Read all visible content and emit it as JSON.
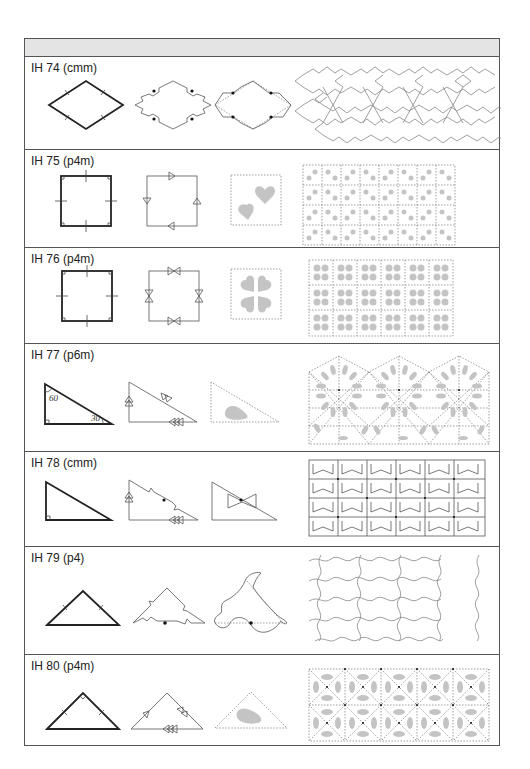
{
  "page": {
    "header_band_text": ""
  },
  "rows": [
    {
      "id": "IH 74",
      "group": "cmm",
      "label": "IH 74 (cmm)",
      "prototile": "rhombus",
      "pattern": "interlocking-star-cross-tiles"
    },
    {
      "id": "IH 75",
      "group": "p4m",
      "label": "IH 75 (p4m)",
      "prototile": "square",
      "pattern": "heart-pairs-grid"
    },
    {
      "id": "IH 76",
      "group": "p4m",
      "label": "IH 76 (p4m)",
      "prototile": "square",
      "pattern": "four-heart-clover-grid"
    },
    {
      "id": "IH 77",
      "group": "p6m",
      "label": "IH 77 (p6m)",
      "prototile": "30-60-90 triangle",
      "angles": {
        "top": "60",
        "right": "30"
      },
      "pattern": "hexagonal-rosette-teardrops"
    },
    {
      "id": "IH 78",
      "group": "cmm",
      "label": "IH 78 (cmm)",
      "prototile": "right triangle",
      "pattern": "bowtie-grid"
    },
    {
      "id": "IH 79",
      "group": "p4",
      "label": "IH 79 (p4)",
      "prototile": "isosceles triangle",
      "pattern": "curvy-animal-motif"
    },
    {
      "id": "IH 80",
      "group": "p4m",
      "label": "IH 80 (p4m)",
      "prototile": "right isosceles triangle",
      "pattern": "teardrop-square-diagonal-grid"
    }
  ],
  "colors": {
    "border": "#555555",
    "header_band": "#e4e4e4",
    "motif_fill": "#c4c4c4",
    "stroke": "#222222"
  }
}
